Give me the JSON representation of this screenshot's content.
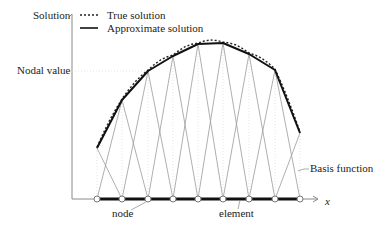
{
  "diagram": {
    "y_axis_label": "Solution",
    "x_axis_label": "x",
    "nodal_value_label": "Nodal value",
    "legend": {
      "items": [
        {
          "label": "True solution",
          "style": "dotted"
        },
        {
          "label": "Approximate solution",
          "style": "solid"
        }
      ]
    },
    "annotations": {
      "basis_function": "Basis function",
      "node": "node",
      "element": "element"
    },
    "nodes_x": [
      97,
      122,
      148,
      173,
      198,
      223,
      249,
      275,
      300
    ],
    "nodal_values_y": [
      148,
      100,
      71,
      56,
      44,
      43,
      54,
      70,
      133
    ],
    "baseline_y": 199
  }
}
